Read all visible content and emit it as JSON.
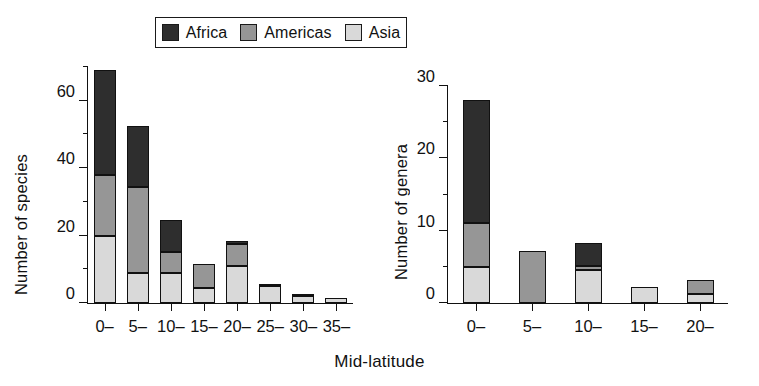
{
  "figure": {
    "xaxis_title": "Mid-latitude",
    "colors": {
      "africa": "#2e2e2e",
      "americas": "#969696",
      "asia": "#d9d9d9",
      "axis": "#111111"
    }
  },
  "legend": {
    "position": "top-center",
    "entries": [
      {
        "label": "Africa",
        "swatch": "africa-swatch",
        "color": "#2e2e2e"
      },
      {
        "label": "Americas",
        "swatch": "americas-swatch",
        "color": "#969696"
      },
      {
        "label": "Asia",
        "swatch": "asia-swatch",
        "color": "#d9d9d9"
      }
    ]
  },
  "chart_data": [
    {
      "id": "species",
      "type": "bar",
      "stacked": true,
      "title": "",
      "xlabel": "Mid-latitude",
      "ylabel": "Number of species",
      "categories": [
        "0–",
        "5–",
        "10–",
        "15–",
        "20–",
        "25–",
        "30–",
        "35–"
      ],
      "series": [
        {
          "name": "Asia",
          "values": [
            20,
            9,
            9,
            4.5,
            11,
            5,
            2,
            1.5
          ]
        },
        {
          "name": "Americas",
          "values": [
            18,
            25.5,
            6,
            7,
            6.5,
            0,
            0.5,
            0
          ]
        },
        {
          "name": "Africa",
          "values": [
            31,
            18,
            9.5,
            0,
            1,
            0.5,
            0,
            0
          ]
        }
      ],
      "totals": [
        69,
        52.5,
        24.5,
        11.5,
        18.5,
        5.5,
        2.5,
        1.5
      ],
      "ylim": [
        0,
        70
      ],
      "yticks_major": [
        0,
        20,
        40,
        60
      ],
      "yticks_minor": [
        10,
        30,
        50,
        70
      ],
      "grid": false
    },
    {
      "id": "genera",
      "type": "bar",
      "stacked": true,
      "title": "",
      "xlabel": "Mid-latitude",
      "ylabel": "Number of genera",
      "categories": [
        "0–",
        "5–",
        "10–",
        "15–",
        "20–"
      ],
      "series": [
        {
          "name": "Asia",
          "values": [
            5,
            0,
            4.5,
            2.2,
            1.2
          ]
        },
        {
          "name": "Americas",
          "values": [
            6,
            7.2,
            0.6,
            0,
            2.0
          ]
        },
        {
          "name": "Africa",
          "values": [
            17,
            0,
            3.2,
            0,
            0
          ]
        }
      ],
      "totals": [
        28,
        7.2,
        8.3,
        2.2,
        3.2
      ],
      "ylim": [
        0,
        30
      ],
      "yticks_major": [
        0,
        10,
        20,
        30
      ],
      "yticks_minor": [
        5,
        15,
        25
      ],
      "grid": false
    }
  ]
}
